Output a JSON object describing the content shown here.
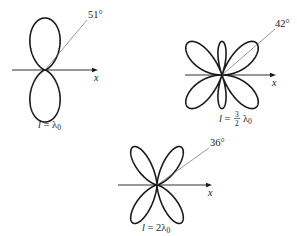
{
  "diagram": {
    "type": "antenna-radiation-patterns",
    "axis_label": "x",
    "patterns": [
      {
        "id": "p1",
        "caption_var": "l",
        "caption_eq": " = ",
        "caption_coef": "",
        "caption_unit": "λ",
        "caption_sub": "0",
        "length_in_wavelengths": 1,
        "angle_label": "51°",
        "angle_deg": 51,
        "center": [
          45,
          70
        ],
        "scale": 52,
        "axis": [
          12,
          98
        ],
        "angle_line_end": [
          87,
          20
        ],
        "angle_label_pos": [
          88,
          18
        ],
        "caption_pos": [
          38,
          128
        ]
      },
      {
        "id": "p2",
        "caption_var": "l",
        "caption_eq": " = ",
        "caption_coef_num": "3",
        "caption_coef_den": "2",
        "caption_unit": "λ",
        "caption_sub": "0",
        "length_in_wavelengths": 1.5,
        "angle_label": "42°",
        "angle_deg": 42,
        "center": [
          222,
          75
        ],
        "scale": 47,
        "axis": [
          185,
          276
        ],
        "angle_line_end": [
          275,
          29
        ],
        "angle_label_pos": [
          275,
          27
        ],
        "caption_pos": [
          233,
          122
        ]
      },
      {
        "id": "p3",
        "caption_var": "l",
        "caption_eq": " = ",
        "caption_coef": "2",
        "caption_unit": "λ",
        "caption_sub": "0",
        "length_in_wavelengths": 2,
        "angle_label": "36°",
        "angle_deg": 36,
        "center": [
          157,
          185
        ],
        "scale": 45,
        "axis": [
          118,
          212
        ],
        "angle_line_end": [
          209,
          148
        ],
        "angle_label_pos": [
          210,
          146
        ],
        "caption_pos": [
          142,
          231
        ]
      }
    ]
  }
}
